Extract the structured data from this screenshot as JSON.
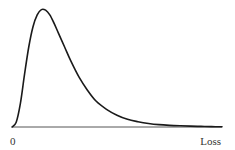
{
  "chart_data": {
    "type": "line",
    "title": "",
    "xlabel": "Loss",
    "ylabel": "",
    "x_tick_labels": [
      "0"
    ],
    "xlim": [
      0,
      1
    ],
    "ylim": [
      0,
      1
    ],
    "grid": false,
    "legend": null,
    "series": [
      {
        "name": "loss-distribution",
        "color": "#1a1a1a",
        "x": [
          0,
          0.02,
          0.04,
          0.06,
          0.08,
          0.1,
          0.12,
          0.14,
          0.16,
          0.18,
          0.2,
          0.22,
          0.25,
          0.28,
          0.32,
          0.36,
          0.4,
          0.45,
          0.5,
          0.55,
          0.6,
          0.65,
          0.7,
          0.75,
          0.8,
          0.85,
          0.9,
          0.95,
          1.0
        ],
        "y": [
          0,
          0.04,
          0.2,
          0.45,
          0.68,
          0.85,
          0.95,
          0.995,
          0.99,
          0.95,
          0.88,
          0.8,
          0.68,
          0.56,
          0.42,
          0.31,
          0.22,
          0.15,
          0.1,
          0.065,
          0.045,
          0.03,
          0.02,
          0.014,
          0.01,
          0.007,
          0.005,
          0.003,
          0.002
        ]
      }
    ]
  }
}
